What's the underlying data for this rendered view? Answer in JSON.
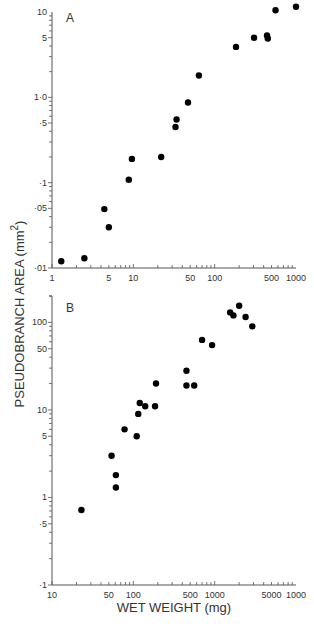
{
  "figure": {
    "y_axis_label": "PSEUDOBRANCH   AREA (mm",
    "y_axis_label_sup": "2",
    "y_axis_label_close": ")",
    "x_axis_label": "WET WEIGHT (mg)"
  },
  "chart_data": [
    {
      "type": "scatter",
      "panel_label": "A",
      "title": "",
      "xlabel": "",
      "ylabel": "PSEUDOBRANCH AREA (mm²)",
      "xscale": "log",
      "yscale": "log",
      "xlim": [
        1,
        1000
      ],
      "ylim": [
        0.01,
        10
      ],
      "x_tick_labels": [
        "1",
        "5",
        "10",
        "50",
        "100",
        "500",
        "1000"
      ],
      "x_tick_values": [
        1,
        5,
        10,
        50,
        100,
        500,
        1000
      ],
      "y_tick_labels": [
        "·01",
        "·05",
        "·1",
        "·5",
        "1·0",
        "5",
        "10"
      ],
      "y_tick_values": [
        0.01,
        0.05,
        0.1,
        0.5,
        1.0,
        5,
        10
      ],
      "grid": false,
      "legend": null,
      "points": [
        {
          "x": 1.3,
          "y": 0.012
        },
        {
          "x": 2.5,
          "y": 0.013
        },
        {
          "x": 4.4,
          "y": 0.049
        },
        {
          "x": 5.0,
          "y": 0.03
        },
        {
          "x": 8.8,
          "y": 0.108
        },
        {
          "x": 9.6,
          "y": 0.19
        },
        {
          "x": 22,
          "y": 0.2
        },
        {
          "x": 33,
          "y": 0.45
        },
        {
          "x": 34,
          "y": 0.55
        },
        {
          "x": 47,
          "y": 0.87
        },
        {
          "x": 64,
          "y": 1.8
        },
        {
          "x": 183,
          "y": 3.9
        },
        {
          "x": 305,
          "y": 5.0
        },
        {
          "x": 440,
          "y": 5.3
        },
        {
          "x": 450,
          "y": 4.9
        },
        {
          "x": 560,
          "y": 10.5
        },
        {
          "x": 1000,
          "y": 11.5
        }
      ]
    },
    {
      "type": "scatter",
      "panel_label": "B",
      "title": "",
      "xlabel": "WET WEIGHT (mg)",
      "ylabel": "PSEUDOBRANCH AREA (mm²)",
      "xscale": "log",
      "yscale": "log",
      "xlim": [
        10,
        10000
      ],
      "ylim": [
        0.1,
        200
      ],
      "x_tick_labels": [
        "10",
        "50",
        "100",
        "500",
        "1000",
        "5000",
        "1000"
      ],
      "x_tick_values": [
        10,
        50,
        100,
        500,
        1000,
        5000,
        10000
      ],
      "y_tick_labels": [
        "·1",
        "·5",
        "1",
        "5",
        "10",
        "50",
        "100"
      ],
      "y_tick_values": [
        0.1,
        0.5,
        1,
        5,
        10,
        50,
        100
      ],
      "grid": false,
      "legend": null,
      "points": [
        {
          "x": 23,
          "y": 0.72
        },
        {
          "x": 54,
          "y": 3.0
        },
        {
          "x": 61,
          "y": 1.8
        },
        {
          "x": 61,
          "y": 1.3
        },
        {
          "x": 78,
          "y": 6
        },
        {
          "x": 110,
          "y": 5
        },
        {
          "x": 115,
          "y": 9
        },
        {
          "x": 120,
          "y": 12
        },
        {
          "x": 140,
          "y": 11
        },
        {
          "x": 185,
          "y": 11
        },
        {
          "x": 190,
          "y": 20
        },
        {
          "x": 450,
          "y": 28
        },
        {
          "x": 450,
          "y": 19
        },
        {
          "x": 560,
          "y": 19
        },
        {
          "x": 700,
          "y": 63
        },
        {
          "x": 930,
          "y": 55
        },
        {
          "x": 1550,
          "y": 130
        },
        {
          "x": 1700,
          "y": 120
        },
        {
          "x": 2000,
          "y": 155
        },
        {
          "x": 2400,
          "y": 115
        },
        {
          "x": 2900,
          "y": 90
        }
      ]
    }
  ]
}
